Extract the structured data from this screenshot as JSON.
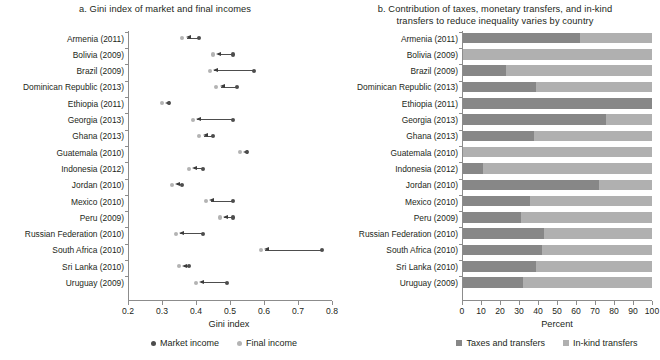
{
  "chart_data": [
    {
      "type": "scatter",
      "panel": "a",
      "title": "a. Gini index of market and final incomes",
      "xlabel": "Gini index",
      "ylabel": "",
      "xlim": [
        0.2,
        0.8
      ],
      "xticks": [
        "0.2",
        "0.3",
        "0.4",
        "0.5",
        "0.6",
        "0.7",
        "0.8"
      ],
      "grid": false,
      "legend_position": "bottom",
      "legend": [
        "Market income",
        "Final income"
      ],
      "categories": [
        "Armenia (2011)",
        "Bolivia (2009)",
        "Brazil (2009)",
        "Dominican Republic (2013)",
        "Ethiopia (2011)",
        "Georgia (2013)",
        "Ghana (2013)",
        "Guatemala (2010)",
        "Indonesia (2012)",
        "Jordan (2010)",
        "Mexico (2010)",
        "Peru (2009)",
        "Russian Federation (2010)",
        "South Africa (2010)",
        "Sri Lanka (2010)",
        "Uruguay (2009)"
      ],
      "series": [
        {
          "name": "Market income",
          "color": "#4d4d4d",
          "values": [
            0.41,
            0.51,
            0.57,
            0.52,
            0.32,
            0.51,
            0.45,
            0.55,
            0.42,
            0.36,
            0.51,
            0.51,
            0.42,
            0.77,
            0.38,
            0.49
          ]
        },
        {
          "name": "Final income",
          "color": "#b3b3b3",
          "values": [
            0.36,
            0.45,
            0.44,
            0.46,
            0.3,
            0.39,
            0.41,
            0.53,
            0.38,
            0.33,
            0.43,
            0.47,
            0.34,
            0.59,
            0.35,
            0.4
          ]
        }
      ]
    },
    {
      "type": "bar",
      "panel": "b",
      "orientation": "horizontal",
      "stacked": true,
      "title": "b. Contribution of taxes, monetary transfers, and in-kind transfers to reduce inequality varies by country",
      "xlabel": "Percent",
      "ylabel": "",
      "xlim": [
        0,
        100
      ],
      "xticks": [
        "0",
        "10",
        "20",
        "30",
        "40",
        "50",
        "60",
        "70",
        "80",
        "90",
        "100"
      ],
      "grid": false,
      "legend_position": "bottom",
      "legend": [
        "Taxes and transfers",
        "In-kind transfers"
      ],
      "categories": [
        "Armenia (2011)",
        "Bolivia (2009)",
        "Brazil (2009)",
        "Dominican Republic (2013)",
        "Ethiopia (2011)",
        "Georgia (2013)",
        "Ghana (2013)",
        "Guatemala (2010)",
        "Indonesia (2012)",
        "Jordan (2010)",
        "Mexico (2010)",
        "Peru (2009)",
        "Russian Federation (2010)",
        "South Africa (2010)",
        "Sri Lanka (2010)",
        "Uruguay (2009)"
      ],
      "series": [
        {
          "name": "Taxes and transfers",
          "color": "#878787",
          "values": [
            62,
            0,
            23,
            39,
            100,
            76,
            38,
            0,
            11,
            72,
            36,
            31,
            43,
            42,
            39,
            32
          ]
        },
        {
          "name": "In-kind transfers",
          "color": "#b0b0b0",
          "values": [
            38,
            100,
            77,
            61,
            0,
            24,
            62,
            100,
            89,
            28,
            64,
            69,
            57,
            58,
            61,
            68
          ]
        }
      ]
    }
  ],
  "panel_a": {
    "title": "a. Gini index of market and final incomes",
    "axis_title": "Gini index",
    "legend": [
      {
        "label": "Market income",
        "color": "#4d4d4d"
      },
      {
        "label": "Final income",
        "color": "#b3b3b3"
      }
    ]
  },
  "panel_b": {
    "title_line1": "b. Contribution of taxes, monetary transfers, and in-kind",
    "title_line2": "transfers to reduce inequality varies by country",
    "axis_title": "Percent",
    "legend": [
      {
        "label": "Taxes and transfers",
        "color": "#878787"
      },
      {
        "label": "In-kind transfers",
        "color": "#b0b0b0"
      }
    ]
  }
}
